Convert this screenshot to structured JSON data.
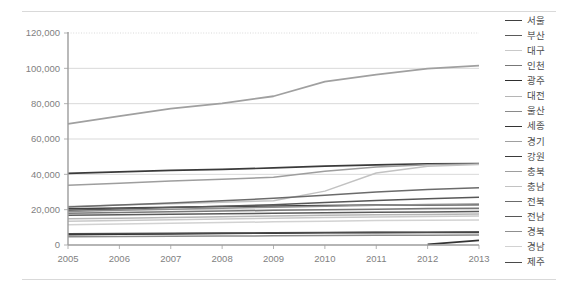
{
  "chart_data": {
    "type": "line",
    "title": "",
    "xlabel": "",
    "ylabel": "",
    "categories": [
      "2005",
      "2006",
      "2007",
      "2008",
      "2009",
      "2010",
      "2011",
      "2012",
      "2013"
    ],
    "x": [
      2005,
      2006,
      2007,
      2008,
      2009,
      2010,
      2011,
      2012,
      2013
    ],
    "ylim": [
      0,
      120000
    ],
    "ytick_values": [
      0,
      20000,
      40000,
      60000,
      80000,
      100000,
      120000
    ],
    "ytick_labels": [
      "0",
      "20,000",
      "40,000",
      "60,000",
      "80,000",
      "100,000",
      "120,000"
    ],
    "grid": true,
    "legend_position": "right",
    "series": [
      {
        "name": "서울",
        "color": "#404040",
        "width": 1.5,
        "values": [
          20500,
          21000,
          21400,
          21800,
          22100,
          22400,
          22600,
          22700,
          22800
        ]
      },
      {
        "name": "부산",
        "color": "#5a5a5a",
        "width": 1.5,
        "values": [
          16800,
          17100,
          17400,
          17700,
          18000,
          18300,
          18500,
          18700,
          18900
        ]
      },
      {
        "name": "대구",
        "color": "#c9c9c9",
        "width": 1.5,
        "values": [
          13500,
          13900,
          14300,
          14700,
          15100,
          15500,
          15900,
          16200,
          16400
        ]
      },
      {
        "name": "인천",
        "color": "#777777",
        "width": 1.5,
        "values": [
          18000,
          18400,
          18800,
          19200,
          19600,
          20000,
          20300,
          20600,
          20800
        ]
      },
      {
        "name": "광주",
        "color": "#2e2e2e",
        "width": 1.6,
        "values": [
          5900,
          6100,
          6300,
          6500,
          6700,
          6900,
          7000,
          7100,
          7150
        ]
      },
      {
        "name": "대전",
        "color": "#b5b5b5",
        "width": 1.5,
        "values": [
          14800,
          15200,
          15600,
          16000,
          16400,
          16800,
          17100,
          17300,
          17500
        ]
      },
      {
        "name": "울산",
        "color": "#8a8a8a",
        "width": 1.5,
        "values": [
          4600,
          4750,
          4900,
          5050,
          5200,
          5350,
          5450,
          5550,
          5600
        ]
      },
      {
        "name": "세종",
        "color": "#333333",
        "width": 1.8,
        "values": [
          null,
          null,
          null,
          null,
          null,
          null,
          null,
          400,
          2600
        ]
      },
      {
        "name": "경기",
        "color": "#a0a0a0",
        "width": 1.8,
        "values": [
          68500,
          73000,
          77200,
          80200,
          84200,
          92500,
          96500,
          99800,
          101500
        ]
      },
      {
        "name": "강원",
        "color": "#3a3a3a",
        "width": 1.7,
        "values": [
          40500,
          41400,
          42200,
          42800,
          43600,
          44600,
          45400,
          45900,
          46100
        ]
      },
      {
        "name": "충북",
        "color": "#9e9e9e",
        "width": 1.5,
        "values": [
          33800,
          35000,
          36200,
          37200,
          38400,
          41800,
          44200,
          45400,
          45900
        ]
      },
      {
        "name": "충남",
        "color": "#c2c2c2",
        "width": 1.5,
        "values": [
          21800,
          22600,
          23400,
          24200,
          25000,
          30500,
          40800,
          44600,
          45600
        ]
      },
      {
        "name": "전북",
        "color": "#6b6b6b",
        "width": 1.5,
        "values": [
          21500,
          22600,
          23800,
          25000,
          26400,
          28200,
          30000,
          31400,
          32400
        ]
      },
      {
        "name": "전남",
        "color": "#575757",
        "width": 1.5,
        "values": [
          19600,
          20400,
          21200,
          22000,
          22800,
          24000,
          25200,
          26200,
          27000
        ]
      },
      {
        "name": "경북",
        "color": "#8f8f8f",
        "width": 1.5,
        "values": [
          19000,
          19600,
          20200,
          20800,
          21400,
          22000,
          22500,
          22900,
          23200
        ]
      },
      {
        "name": "경남",
        "color": "#d2d2d2",
        "width": 1.5,
        "values": [
          11500,
          11900,
          12300,
          12700,
          13100,
          13500,
          13800,
          14000,
          14200
        ]
      },
      {
        "name": "제주",
        "color": "#4a4a4a",
        "width": 1.5,
        "values": [
          6300,
          6450,
          6600,
          6750,
          6900,
          7050,
          7150,
          7250,
          7300
        ]
      }
    ]
  },
  "plot": {
    "left": 68,
    "right": 479,
    "top": 33,
    "bottom": 245
  }
}
